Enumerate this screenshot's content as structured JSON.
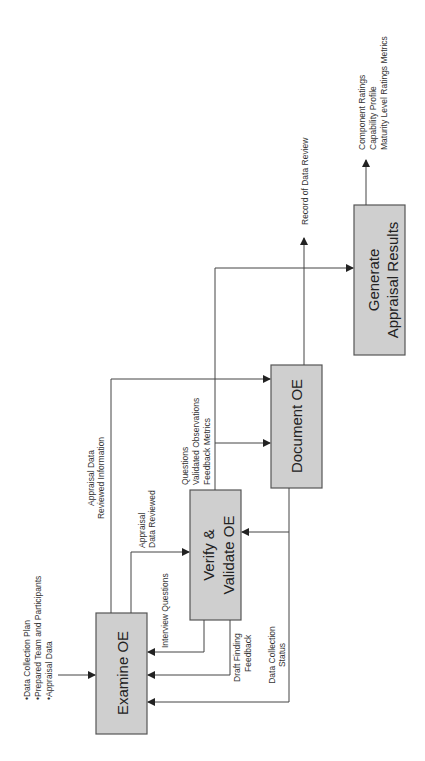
{
  "diagram": {
    "orientation": "rotated -90deg",
    "boxes": {
      "examine": {
        "line1": "Examine OE"
      },
      "verify": {
        "line1": "Verify &",
        "line2": "Validate OE"
      },
      "document": {
        "line1": "Document OE"
      },
      "generate": {
        "line1": "Generate",
        "line2": "Appraisal Results"
      }
    },
    "inputs": {
      "line1": "•Data Collection Plan",
      "line2": "•Prepared Team and Participants",
      "line3": "•Appraisal Data"
    },
    "labels": {
      "appraisal_data_reviewed_1": "Appraisal",
      "appraisal_data_reviewed_2": "Data Reviewed",
      "appraisal_data_info_1": "Appraisal Data",
      "appraisal_data_info_2": "Reviewed Information",
      "interview_questions": "Interview Questions",
      "draft_finding_1": "Draft Finding",
      "draft_finding_2": "Feedback",
      "data_collection_1": "Data Collection",
      "data_collection_2": "Status",
      "questions_1": "Questions",
      "questions_2": "Validated Observations",
      "questions_3": "Feedback Metrics",
      "record": "Record of Data Review",
      "outputs_1": "Component Ratings",
      "outputs_2": "Capability Profile",
      "outputs_3": "Maturity Level Ratings Metrics"
    },
    "colors": {
      "box_fill": "#cfcfcf",
      "box_stroke": "#555555",
      "line": "#444444"
    }
  }
}
